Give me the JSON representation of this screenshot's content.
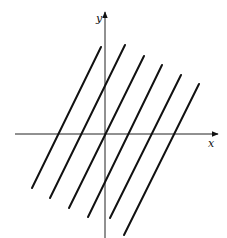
{
  "diagram": {
    "axes": {
      "x": {
        "label": "x",
        "from": [
          15,
          134
        ],
        "to": [
          218,
          134
        ]
      },
      "y": {
        "label": "y",
        "from": [
          105,
          238
        ],
        "to": [
          105,
          12
        ]
      }
    },
    "lines": [
      {
        "x1": 101,
        "y1": 47,
        "x2": 32,
        "y2": 188
      },
      {
        "x1": 125,
        "y1": 45,
        "x2": 50,
        "y2": 198
      },
      {
        "x1": 144,
        "y1": 56,
        "x2": 69,
        "y2": 208
      },
      {
        "x1": 162,
        "y1": 65,
        "x2": 88,
        "y2": 217
      },
      {
        "x1": 181,
        "y1": 75,
        "x2": 110,
        "y2": 218
      },
      {
        "x1": 199,
        "y1": 84,
        "x2": 124,
        "y2": 235
      }
    ],
    "colors": {
      "ink": "#111111",
      "background": "#ffffff"
    }
  }
}
